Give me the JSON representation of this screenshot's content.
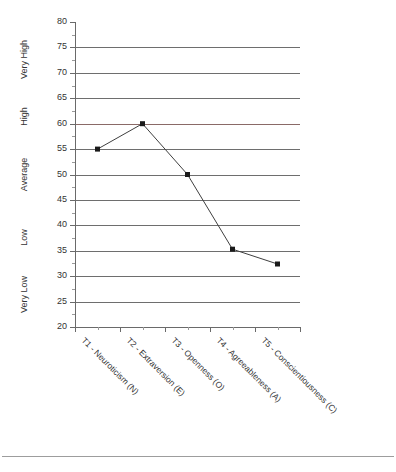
{
  "chart_data": {
    "type": "line",
    "title": "",
    "xlabel": "",
    "ylabel": "",
    "categories": [
      "T1 - Neuroticism (N)",
      "T2 - Extraversion (E)",
      "T3 - Openness (O)",
      "T4 - Agreeableness (A)",
      "T5 - Conscientiousness (C)"
    ],
    "values": [
      55,
      60,
      50,
      35.3,
      32.4
    ],
    "ylim": [
      20,
      80
    ],
    "y_tick_step": 5,
    "y_minor_step": 2.5,
    "y_ticks": [
      20,
      25,
      30,
      35,
      40,
      45,
      50,
      55,
      60,
      65,
      70,
      75,
      80
    ],
    "y_tick_labels": [
      "20",
      "25",
      "30",
      "35",
      "40",
      "45",
      "50",
      "55",
      "60",
      "65",
      "70",
      "75",
      "80"
    ],
    "gridlines": [
      25,
      30,
      35,
      40,
      45,
      50,
      55,
      60,
      65,
      70,
      75
    ],
    "accent_gridline": 60,
    "grid": true,
    "legend": "none",
    "band_labels": [
      {
        "label": "Very High",
        "from": 65,
        "to": 80
      },
      {
        "label": "High",
        "from": 57.5,
        "to": 65
      },
      {
        "label": "Average",
        "from": 42.5,
        "to": 57.5
      },
      {
        "label": "Low",
        "from": 32.5,
        "to": 42.5
      },
      {
        "label": "Very Low",
        "from": 20,
        "to": 32.5
      }
    ],
    "colors": {
      "line": "#3f3f3f",
      "marker": "#1a1a1a",
      "grid": "#6e6e6e",
      "accent_grid": "#8a6a67",
      "axis": "#6a6a6a",
      "text": "#333333"
    },
    "marker_style": "square",
    "marker_size": 5
  }
}
